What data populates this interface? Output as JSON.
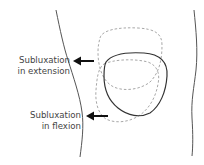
{
  "diagram": {
    "labels": {
      "extension": {
        "line1": "Subluxation",
        "line2": "in extension"
      },
      "flexion": {
        "line1": "Subluxation",
        "line2": "in flexion"
      }
    },
    "colors": {
      "outline": "#444444",
      "dashed": "#a8a8a8",
      "arrow": "#111111",
      "text": "#444444"
    }
  }
}
